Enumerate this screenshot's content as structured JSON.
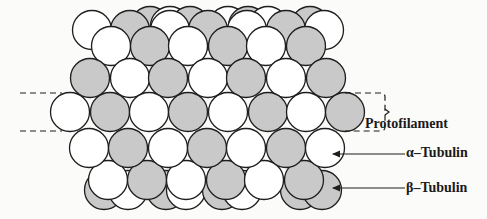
{
  "figure": {
    "colors": {
      "alpha_fill": "#ffffff",
      "beta_fill": "#c9c9c9",
      "stroke": "#1e1e1e",
      "background": "#fbfbf9"
    },
    "labels": {
      "protofilament": "Protofilament",
      "alpha_tubulin": "α–Tubulin",
      "beta_tubulin": "β–Tubulin"
    },
    "radius": 19.5,
    "rows": [
      {
        "name": "back-top",
        "y": 26,
        "circles": [
          [
            "g",
            150
          ],
          [
            "w",
            170
          ],
          [
            "g",
            190
          ],
          [
            "w",
            228
          ],
          [
            "g",
            248
          ],
          [
            "w",
            268
          ],
          [
            "g",
            310
          ]
        ]
      },
      {
        "name": "row-1",
        "y": 30,
        "circles": [
          [
            "w",
            92
          ],
          [
            "g",
            130
          ],
          [
            "w",
            170
          ],
          [
            "g",
            208
          ],
          [
            "w",
            247
          ],
          [
            "g",
            286
          ],
          [
            "w",
            324
          ]
        ]
      },
      {
        "name": "row-2",
        "y": 46,
        "circles": [
          [
            "w",
            111
          ],
          [
            "g",
            150
          ],
          [
            "w",
            188
          ],
          [
            "g",
            228
          ],
          [
            "w",
            266
          ],
          [
            "g",
            306
          ]
        ]
      },
      {
        "name": "row-3",
        "y": 78,
        "circles": [
          [
            "g",
            90
          ],
          [
            "w",
            130
          ],
          [
            "g",
            168
          ],
          [
            "w",
            208
          ],
          [
            "g",
            246
          ],
          [
            "w",
            286
          ],
          [
            "g",
            326
          ]
        ]
      },
      {
        "name": "protofilament-row",
        "y": 112,
        "circles": [
          [
            "w",
            70
          ],
          [
            "g",
            110
          ],
          [
            "w",
            149
          ],
          [
            "g",
            188
          ],
          [
            "w",
            228
          ],
          [
            "g",
            268
          ],
          [
            "w",
            306
          ],
          [
            "g",
            345
          ]
        ]
      },
      {
        "name": "row-5",
        "y": 148,
        "circles": [
          [
            "w",
            89
          ],
          [
            "g",
            128
          ],
          [
            "w",
            168
          ],
          [
            "g",
            207
          ],
          [
            "w",
            246
          ],
          [
            "g",
            286
          ],
          [
            "w",
            325
          ]
        ]
      },
      {
        "name": "back-bottom",
        "y": 190,
        "circles": [
          [
            "g",
            104
          ],
          [
            "w",
            128
          ],
          [
            "g",
            166
          ],
          [
            "w",
            186
          ],
          [
            "g",
            222
          ],
          [
            "w",
            242
          ],
          [
            "g",
            300
          ],
          [
            "g",
            322
          ]
        ]
      },
      {
        "name": "row-6",
        "y": 180,
        "circles": [
          [
            "w",
            108
          ],
          [
            "g",
            147
          ],
          [
            "w",
            186
          ],
          [
            "g",
            226
          ],
          [
            "w",
            264
          ],
          [
            "g",
            304
          ]
        ]
      }
    ],
    "protofilament_band": {
      "top": 93,
      "bottom": 131,
      "left_dash_start": 20,
      "right_x": 385
    },
    "arrows": [
      {
        "name": "alpha",
        "from_x": 405,
        "to_x": 333,
        "y": 154
      },
      {
        "name": "beta",
        "from_x": 405,
        "to_x": 333,
        "y": 188
      }
    ]
  }
}
